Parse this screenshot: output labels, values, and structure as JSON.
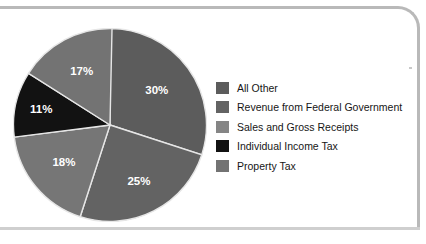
{
  "chart_data": {
    "type": "pie",
    "title": "",
    "subtitle": "",
    "xlabel": "",
    "ylabel": "",
    "legend_position": "right",
    "grid": false,
    "units": "percent",
    "categories": [
      "All Other",
      "Revenue from Federal Government",
      "Sales and Gross Receipts",
      "Individual Income Tax",
      "Property Tax"
    ],
    "values": [
      30,
      25,
      18,
      11,
      17
    ],
    "slices": [
      {
        "label": "All Other",
        "value": 30,
        "value_label": "30%",
        "color": "#5c5c5c",
        "start_angle": 0,
        "end_angle": 108
      },
      {
        "label": "Revenue from Federal Government",
        "value": 25,
        "value_label": "25%",
        "color": "#636363",
        "start_angle": 108,
        "end_angle": 198
      },
      {
        "label": "Sales and Gross Receipts",
        "value": 18,
        "value_label": "18%",
        "color": "#767676",
        "start_angle": 198,
        "end_angle": 262.8
      },
      {
        "label": "Individual Income Tax",
        "value": 11,
        "value_label": "11%",
        "color": "#121212",
        "start_angle": 262.8,
        "end_angle": 302.4
      },
      {
        "label": "Property Tax",
        "value": 17,
        "value_label": "17%",
        "color": "#737373",
        "start_angle": 302.4,
        "end_angle": 361.2
      }
    ],
    "legend": [
      {
        "label": "All Other",
        "color": "#5c5c5c"
      },
      {
        "label": "Revenue from Federal Government",
        "color": "#636363"
      },
      {
        "label": "Sales and Gross Receipts",
        "color": "#858585"
      },
      {
        "label": "Individual Income Tax",
        "color": "#121212"
      },
      {
        "label": "Property Tax",
        "color": "#737373"
      }
    ],
    "slice_labels": [
      "30%",
      "25%",
      "18%",
      "11%",
      "17%"
    ],
    "label_color": "#ffffff",
    "separator_color": "#e6e6e6",
    "frame_color": "#b9b9b9",
    "background_color": "#ffffff"
  }
}
